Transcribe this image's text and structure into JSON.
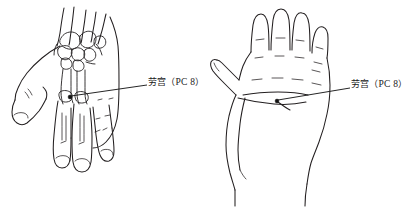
{
  "figure": {
    "background_color": "#ffffff",
    "ink_color": "#231f20",
    "width": 420,
    "height": 207
  },
  "panels": [
    {
      "id": "left-panel",
      "view": "手背斜侧视图",
      "hand": "left-hand-dorsal-oblique",
      "acupoint": {
        "name": "劳宫",
        "code": "PC 8",
        "label": "劳宫（PC 8）",
        "marker": "filled-dot",
        "x": 70,
        "y": 97
      },
      "leader": {
        "from_x": 71,
        "from_y": 96,
        "to_x": 147,
        "to_y": 85
      }
    },
    {
      "id": "right-panel",
      "view": "手掌视图",
      "hand": "right-hand-palmar",
      "acupoint": {
        "name": "劳宫",
        "code": "PC 8",
        "label": "劳宫（PC 8）",
        "marker": "filled-dot",
        "x": 277,
        "y": 101
      },
      "leader": {
        "from_x": 278,
        "from_y": 100,
        "to_x": 350,
        "to_y": 88
      }
    }
  ],
  "labels": {
    "left": {
      "han": "劳宫",
      "paren_open": "（",
      "code": "PC 8",
      "paren_close": "）",
      "full": "劳宫（PC 8）"
    },
    "right": {
      "han": "劳宫",
      "paren_open": "（",
      "code": "PC 8",
      "paren_close": "）",
      "full": "劳宫（PC 8）"
    }
  }
}
